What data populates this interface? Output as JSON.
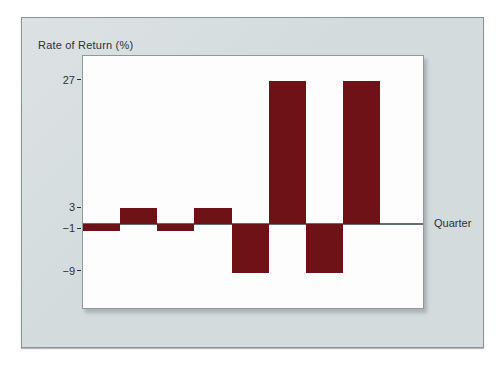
{
  "chart_data": {
    "type": "bar",
    "title": "Rate of Return (%)",
    "xlabel": "Quarter",
    "values": [
      -1,
      3,
      -1,
      3,
      -9,
      27,
      -9,
      27
    ],
    "yticks": [
      27,
      3,
      -1,
      -9
    ],
    "ylim": [
      -15.8,
      31.7
    ],
    "zero_line_value": 0,
    "grid": false,
    "legend": false,
    "bars_adjacent": true
  },
  "colors": {
    "page_bg": "#ffffff",
    "panel_bg": "#d3dbdd",
    "panel_bg_light": "#dce2e3",
    "panel_border": "#8c9498",
    "plot_bg": "#fdfdfd",
    "plot_border": "#8f989b",
    "axis_line": "#646d71",
    "bar": "#6f1217",
    "text": "#2e3134"
  }
}
